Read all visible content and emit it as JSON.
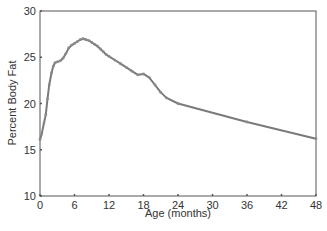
{
  "chart_data": {
    "type": "line",
    "title": "",
    "xlabel": "Age (months)",
    "ylabel": "Percent Body Fat",
    "xlim": [
      0,
      48
    ],
    "ylim": [
      10,
      30
    ],
    "xticks": [
      0,
      6,
      12,
      18,
      24,
      30,
      36,
      42,
      48
    ],
    "yticks": [
      10,
      15,
      20,
      25,
      30
    ],
    "grid": false,
    "legend": null,
    "series": [
      {
        "name": "Percent Body Fat",
        "color": "#7a7a7a",
        "x": [
          0,
          0.3,
          0.7,
          1,
          1.3,
          1.6,
          2,
          2.3,
          2.6,
          3,
          3.5,
          4,
          4.5,
          5,
          5.5,
          6,
          6.5,
          7,
          7.5,
          8,
          8.5,
          9,
          9.5,
          10,
          10.5,
          11,
          11.5,
          12,
          13,
          14,
          15,
          16,
          17,
          18,
          19,
          20,
          21,
          22,
          24,
          36,
          48
        ],
        "y": [
          16.1,
          16.7,
          17.9,
          18.8,
          20.5,
          22.0,
          23.3,
          24.0,
          24.4,
          24.5,
          24.6,
          24.9,
          25.4,
          26.0,
          26.3,
          26.5,
          26.7,
          26.9,
          27.0,
          26.9,
          26.8,
          26.6,
          26.4,
          26.2,
          25.9,
          25.6,
          25.3,
          25.1,
          24.7,
          24.3,
          23.9,
          23.5,
          23.1,
          23.2,
          22.8,
          22.0,
          21.2,
          20.6,
          20.0,
          18.0,
          16.2
        ]
      }
    ]
  },
  "colors": {
    "axis": "#555555",
    "line": "#7a7a7a",
    "background": "#ffffff"
  }
}
